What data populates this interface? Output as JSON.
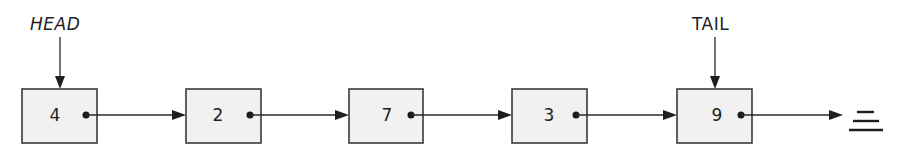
{
  "diagram": {
    "type": "singly-linked-list",
    "pointers": {
      "head": {
        "label": "HEAD",
        "target_index": 0
      },
      "tail": {
        "label": "TAIL",
        "target_index": 4
      }
    },
    "nodes": [
      {
        "value": "4"
      },
      {
        "value": "2"
      },
      {
        "value": "7"
      },
      {
        "value": "3"
      },
      {
        "value": "9"
      }
    ],
    "terminator": "null-ground-symbol",
    "colors": {
      "node_fill": "#f1f1f1",
      "stroke": "#3a3a3a",
      "text": "#222222",
      "background": "#ffffff"
    }
  }
}
